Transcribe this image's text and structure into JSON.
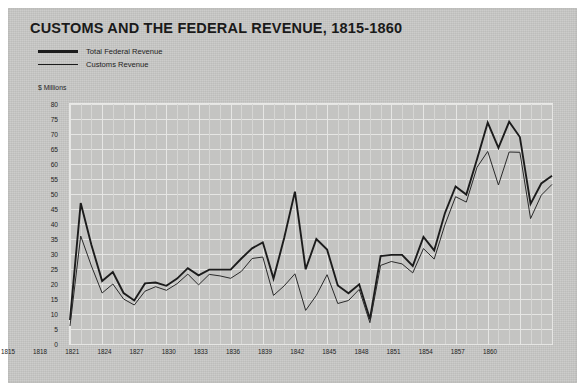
{
  "figure": {
    "title": "CUSTOMS AND THE FEDERAL REVENUE, 1815-1860",
    "units_label": "$ Millions",
    "background_color": "#c9c9c7",
    "plot_background_color": "#c4c4c2",
    "grid_color": "#e6e6e4",
    "line_color": "#1c1c1c"
  },
  "legend": {
    "position": "top-left",
    "items": [
      {
        "label": "Total Federal Revenue",
        "style": "thick"
      },
      {
        "label": "Customs Revenue",
        "style": "thin"
      }
    ]
  },
  "chart_data": {
    "type": "line",
    "title": "CUSTOMS AND THE FEDERAL REVENUE, 1815-1860",
    "xlabel": "",
    "ylabel": "$ Millions",
    "xlim": [
      1815,
      1860
    ],
    "ylim": [
      0,
      80
    ],
    "ytick_step": 5,
    "grid": true,
    "legend_position": "top-left",
    "x": [
      1815,
      1816,
      1817,
      1818,
      1819,
      1820,
      1821,
      1822,
      1823,
      1824,
      1825,
      1826,
      1827,
      1828,
      1829,
      1830,
      1831,
      1832,
      1833,
      1834,
      1835,
      1836,
      1837,
      1838,
      1839,
      1840,
      1841,
      1842,
      1843,
      1844,
      1845,
      1846,
      1847,
      1848,
      1849,
      1850,
      1851,
      1852,
      1853,
      1854,
      1855,
      1856,
      1857,
      1858,
      1859,
      1860
    ],
    "ytick_labels": [
      "0",
      "5",
      "10",
      "15",
      "20",
      "25",
      "30",
      "35",
      "40",
      "45",
      "50",
      "55",
      "60",
      "65",
      "70",
      "75",
      "80"
    ],
    "xtick_labels": [
      "1815",
      "1818",
      "1821",
      "1824",
      "1827",
      "1830",
      "1833",
      "1836",
      "1839",
      "1842",
      "1845",
      "1848",
      "1851",
      "1854",
      "1857",
      "1860"
    ],
    "series": [
      {
        "name": "Total Federal Revenue",
        "style": "thick",
        "color": "#1c1c1c",
        "values": [
          8,
          47,
          33,
          21,
          24,
          17,
          14.5,
          20.2,
          20.5,
          19.4,
          21.8,
          25.3,
          22.9,
          24.8,
          24.8,
          24.8,
          28.5,
          31.9,
          33.9,
          21.8,
          35.4,
          50.8,
          24.9,
          35,
          31.5,
          19.5,
          16.9,
          19.9,
          8.3,
          29.3,
          29.7,
          29.7,
          26,
          35.7,
          31.2,
          43.6,
          52.5,
          49.8,
          61.6,
          73.8,
          65.4,
          74.1,
          69,
          46.7,
          53.5,
          56.1
        ]
      },
      {
        "name": "Customs Revenue",
        "style": "thin",
        "color": "#2a2a2a",
        "values": [
          6,
          36,
          26,
          17,
          20,
          15,
          13,
          17.6,
          19.1,
          17.9,
          20.1,
          23.3,
          19.7,
          23.2,
          22.7,
          21.9,
          24.2,
          28.5,
          29,
          16.2,
          19.4,
          23.4,
          11.2,
          16.2,
          23.1,
          13.5,
          14.5,
          18.2,
          7.1,
          26.2,
          27.5,
          26.7,
          23.7,
          31.8,
          28.3,
          39.7,
          49.1,
          47.3,
          58.9,
          64.2,
          53.0,
          64.0,
          63.9,
          41.8,
          49.6,
          53.2
        ]
      }
    ]
  }
}
